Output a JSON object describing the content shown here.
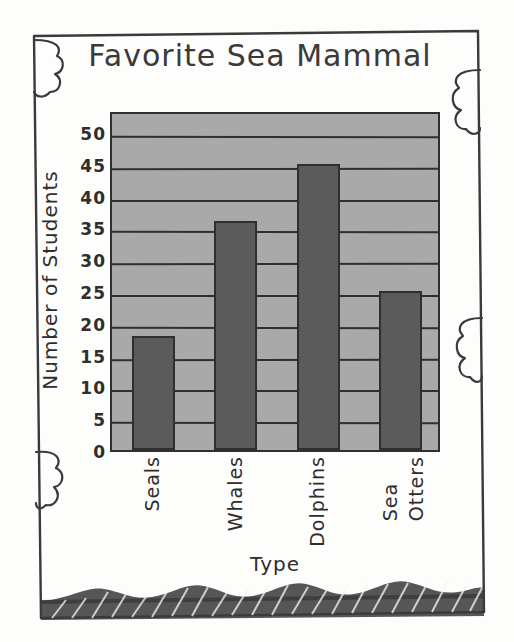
{
  "chart_data": {
    "type": "bar",
    "title": "Favorite Sea Mammal",
    "xlabel": "Type",
    "ylabel": "Number of Students",
    "categories": [
      "Seals",
      "Whales",
      "Dolphins",
      "Sea Otters"
    ],
    "values": [
      18,
      36,
      45,
      25
    ],
    "ylim": [
      0,
      50
    ],
    "ytick_labels": [
      "0",
      "5",
      "10",
      "15",
      "20",
      "25",
      "30",
      "35",
      "40",
      "45",
      "50"
    ],
    "ytick_values": [
      0,
      5,
      10,
      15,
      20,
      25,
      30,
      35,
      40,
      45,
      50
    ],
    "grid": true,
    "legend": "none",
    "style": "hand-drawn sketch",
    "colors": {
      "bar_fill": "#5b5b5b",
      "plot_background": "#a9a9a9",
      "ink": "#2f2f2f",
      "page_background": "#fdfdfc"
    }
  },
  "decorations": {
    "border_style": "hand-drawn rectangle with scalloped cloud bumps",
    "ground_band": "hatched wave band along bottom edge"
  }
}
